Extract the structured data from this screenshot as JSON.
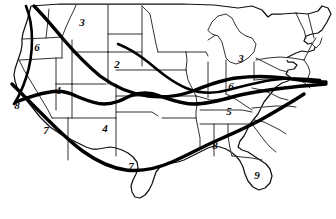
{
  "map": {
    "title": "United States route map with numbered corridor zones",
    "region": "Contiguous United States",
    "style": "black-and-white line art, state boundaries with overlaid thick transcontinental route lines",
    "colors": {
      "background": "#ffffff",
      "state_border": "#1a1a1a",
      "coast_outline": "#111111",
      "route_line": "#000000",
      "label_text": "#0a0a0a"
    },
    "labels": [
      {
        "id": "label-6-northwest",
        "text": "6",
        "x": 37,
        "y": 47,
        "area": "Pacific Northwest / Oregon"
      },
      {
        "id": "label-3-north-plains",
        "text": "3",
        "x": 82,
        "y": 22,
        "area": "Northern Montana / North Dakota"
      },
      {
        "id": "label-2-central-plains",
        "text": "2",
        "x": 117,
        "y": 64,
        "area": "Wyoming / Nebraska"
      },
      {
        "id": "label-1-great-basin",
        "text": "1",
        "x": 59,
        "y": 90,
        "area": "Nevada / Utah"
      },
      {
        "id": "label-8-california",
        "text": "8",
        "x": 17,
        "y": 105,
        "area": "Northern California coast"
      },
      {
        "id": "label-7-southwest",
        "text": "7",
        "x": 46,
        "y": 130,
        "area": "Southern California / Arizona"
      },
      {
        "id": "label-4-southern-plains",
        "text": "4",
        "x": 105,
        "y": 128,
        "area": "New Mexico / Texas panhandle"
      },
      {
        "id": "label-7-texas",
        "text": "7",
        "x": 131,
        "y": 166,
        "area": "Central Texas"
      },
      {
        "id": "label-3-great-lakes",
        "text": "3",
        "x": 241,
        "y": 58,
        "area": "Michigan / Great Lakes"
      },
      {
        "id": "label-6-lake-erie",
        "text": "6",
        "x": 231,
        "y": 86,
        "area": "Ohio / Lake Erie"
      },
      {
        "id": "label-5-upper-south",
        "text": "5",
        "x": 229,
        "y": 111,
        "area": "Kentucky / Tennessee"
      },
      {
        "id": "label-8-deep-south",
        "text": "8",
        "x": 215,
        "y": 145,
        "area": "Alabama / Mississippi"
      },
      {
        "id": "label-9-florida",
        "text": "9",
        "x": 257,
        "y": 175,
        "area": "Florida"
      }
    ],
    "routes": [
      {
        "id": "route-northern-transcontinental",
        "description": "Northwest coast through northern plains to the Great Lakes and Northeast"
      },
      {
        "id": "route-central-transcontinental",
        "description": "Central California through the Great Basin and central plains to the mid-Atlantic"
      },
      {
        "id": "route-southern-transcontinental",
        "description": "Southern California through the desert Southwest and Texas to the Southeast"
      },
      {
        "id": "route-pacific-coast",
        "description": "Pacific coast corridor running north to south"
      },
      {
        "id": "route-great-lakes-east",
        "description": "Great Lakes corridor continuing east to the Atlantic seaboard"
      }
    ]
  }
}
